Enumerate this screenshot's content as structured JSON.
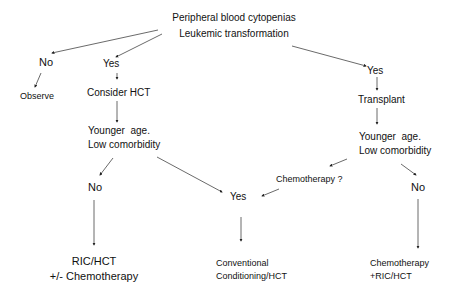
{
  "diagram": {
    "root": {
      "line1": "Peripheral blood cytopenias",
      "line2": "Leukemic transformation"
    },
    "left_no": "No",
    "observe": "Observe",
    "mid_yes": "Yes",
    "consider_hct": "Consider HCT",
    "left_eval": {
      "line1": "Younger  age.",
      "line2": "Low comorbidity"
    },
    "left_eval_no": "No",
    "center_yes": "Yes",
    "ric_hct": {
      "line1": "RIC/HCT",
      "line2": "+/- Chemotherapy"
    },
    "conventional": {
      "line1": "Conventional",
      "line2": "Conditioning/HCT"
    },
    "right_yes": "Yes",
    "transplant": "Transplant",
    "right_eval": {
      "line1": "Younger  age.",
      "line2": "Low comorbidity"
    },
    "chemo_question": "Chemotherapy ?",
    "right_no": "No",
    "chemo_ric": {
      "line1": "Chemotherapy",
      "line2": "+RIC/HCT"
    },
    "colors": {
      "text": "#111111",
      "arrow": "#333333",
      "background": "#ffffff"
    }
  }
}
